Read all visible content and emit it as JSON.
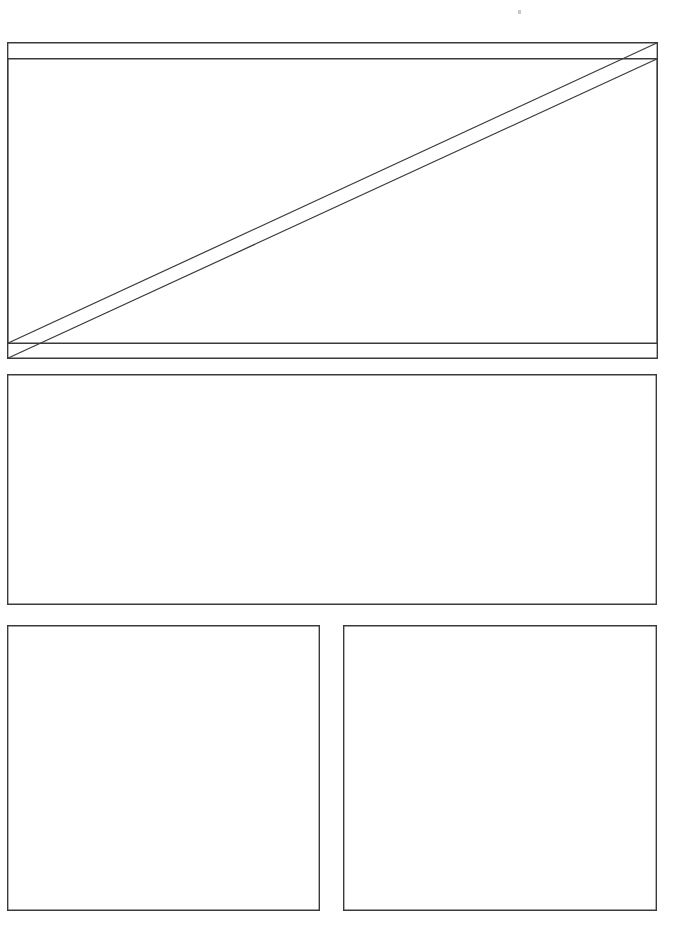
{
  "document": {
    "title": "Panel Layout Diagram",
    "background_color": "#ffffff",
    "stroke_color": "#3a3a3c",
    "speck_color": "#c9c9cc",
    "canvas_width": 692,
    "canvas_height": 946
  },
  "panels": [
    {
      "id": "panel-1-front",
      "label": "Top panel (front plate)",
      "x": 7,
      "y": 42,
      "width": 651,
      "height": 302,
      "has_diagonal": true,
      "diagonal_direction": "bottom-left-to-top-right"
    },
    {
      "id": "panel-1-back",
      "label": "Top panel (offset plate)",
      "x": 7,
      "y": 58,
      "width": 651,
      "height": 301,
      "has_diagonal": true,
      "diagonal_direction": "bottom-left-to-top-right"
    },
    {
      "id": "panel-2",
      "label": "Middle panel",
      "x": 7,
      "y": 374,
      "width": 650,
      "height": 231,
      "has_diagonal": false,
      "diagonal_direction": "none"
    },
    {
      "id": "panel-3",
      "label": "Bottom left panel",
      "x": 7,
      "y": 625,
      "width": 313,
      "height": 286,
      "has_diagonal": false,
      "diagonal_direction": "none"
    },
    {
      "id": "panel-4",
      "label": "Bottom right panel",
      "x": 343,
      "y": 625,
      "width": 314,
      "height": 286,
      "has_diagonal": false,
      "diagonal_direction": "none"
    }
  ],
  "marks": [
    {
      "id": "speck-top",
      "label": "Faint speck",
      "x": 518,
      "y": 10,
      "width": 3,
      "height": 4
    }
  ],
  "annotations": {
    "panel_count_label": "5",
    "note": ""
  }
}
